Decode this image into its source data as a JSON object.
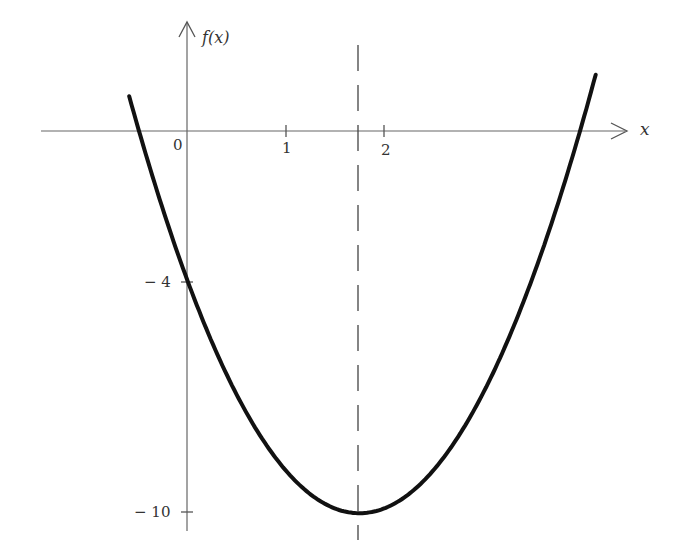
{
  "chart_data": {
    "type": "line",
    "title": "",
    "function": "f(x) = 2x^2 - 7x - 4",
    "xlabel": "x",
    "ylabel": "f(x)",
    "x_ticks": [
      0,
      1,
      2
    ],
    "x_tick_labels": [
      "0",
      "1",
      "2"
    ],
    "y_ticks": [
      -4,
      -10
    ],
    "y_tick_labels": [
      "− 4",
      "− 10"
    ],
    "roots": [
      -0.5,
      4
    ],
    "y_intercept": -4,
    "vertex": {
      "x": 1.75,
      "y": -10.125
    },
    "axis_of_symmetry": {
      "x": 1.75,
      "style": "dashed"
    },
    "xlim": [
      -1.5,
      4.6
    ],
    "ylim": [
      -10.6,
      2.3
    ],
    "grid": false,
    "legend": null,
    "series": [
      {
        "name": "f(x)",
        "x": [
          -0.6,
          -0.5,
          0,
          0.5,
          1,
          1.5,
          1.75,
          2,
          2.5,
          3,
          3.5,
          4,
          4.16
        ],
        "values": [
          0.92,
          0,
          -4,
          -7,
          -9,
          -10,
          -10.125,
          -10,
          -9,
          -7,
          -4,
          0,
          1.51
        ]
      }
    ]
  },
  "labels": {
    "y_axis": "f(x)",
    "x_axis": "x",
    "origin": "0",
    "tick_1": "1",
    "tick_2": "2",
    "tick_neg4": "− 4",
    "tick_neg10": "− 10"
  }
}
